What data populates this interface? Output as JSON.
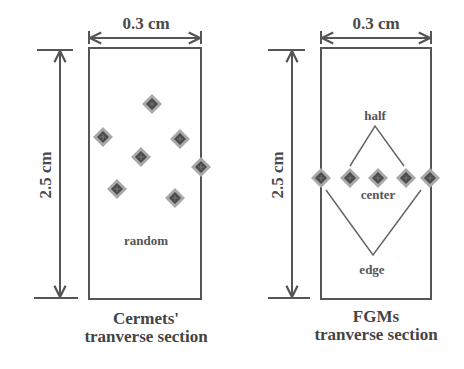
{
  "diagram": {
    "left_panel": {
      "width_label": "0.3 cm",
      "height_label": "2.5 cm",
      "region_label": "random",
      "caption_line1": "Cermets'",
      "caption_line2": "tranverse section",
      "points": [
        {
          "x": 152,
          "y": 104
        },
        {
          "x": 103,
          "y": 137
        },
        {
          "x": 180,
          "y": 139
        },
        {
          "x": 141,
          "y": 157
        },
        {
          "x": 201,
          "y": 167
        },
        {
          "x": 117,
          "y": 189
        },
        {
          "x": 175,
          "y": 198
        }
      ]
    },
    "right_panel": {
      "width_label": "0.3 cm",
      "height_label": "2.5 cm",
      "labels": {
        "half": "half",
        "center": "center",
        "edge": "edge"
      },
      "caption_line1": "FGMs",
      "caption_line2": "tranverse section",
      "points": [
        {
          "x": 321,
          "y": 178
        },
        {
          "x": 350,
          "y": 178
        },
        {
          "x": 378,
          "y": 178
        },
        {
          "x": 406,
          "y": 178
        },
        {
          "x": 430,
          "y": 178
        }
      ]
    },
    "colors": {
      "line": "#555555",
      "point_outer": "#9a9a9a",
      "point_inner": "#4a4a4a",
      "text": "#444444"
    }
  }
}
